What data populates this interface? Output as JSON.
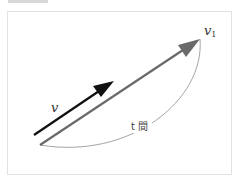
{
  "diagram": {
    "labels": {
      "v": "v",
      "v1_base": "v",
      "v1_sub": "1",
      "time": "t 間"
    },
    "colors": {
      "v_arrow": "#111111",
      "v1_arrow": "#6a6a6a",
      "arc": "#9a9a9a",
      "frame": "#e2e2e2",
      "label": "#333333"
    }
  }
}
